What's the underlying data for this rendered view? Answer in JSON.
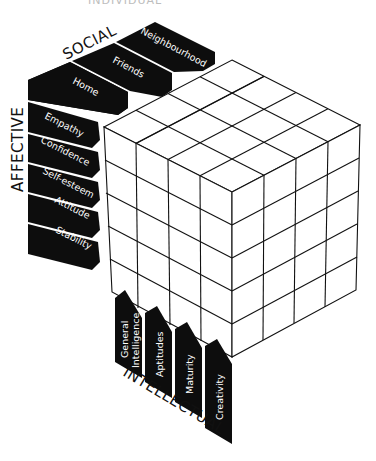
{
  "diagram": {
    "type": "isometric-cube-model",
    "top_title_clipped": "INDIVIDUAL",
    "cube": {
      "columns": 4,
      "depth": 4,
      "rows": 5
    },
    "axes": {
      "social": {
        "title": "SOCIAL",
        "items": [
          "Home",
          "Friends",
          "Neighbourhood"
        ]
      },
      "affective": {
        "title": "AFFECTIVE",
        "items": [
          "Empathy",
          "Confidence",
          "Self-esteem",
          "Attitude",
          "Stability"
        ]
      },
      "intellectual": {
        "title": "INTELLECTUAL",
        "items": [
          "General Intelligence",
          "Aptitudes",
          "Maturity",
          "Creativity"
        ],
        "item_lines": [
          [
            "General",
            "Intelligence"
          ],
          [
            "Aptitudes"
          ],
          [
            "Maturity"
          ],
          [
            "Creativity"
          ]
        ]
      }
    },
    "colors": {
      "tab_fill": "#0d0d0d",
      "tab_text": "#ffffff",
      "line": "#111111",
      "background": "#ffffff"
    }
  }
}
